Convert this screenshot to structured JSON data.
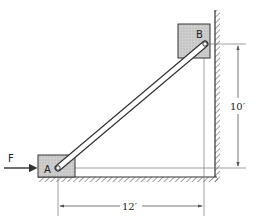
{
  "diagram": {
    "type": "statics-ladder-rod",
    "labels": {
      "force": "F",
      "block_a": "A",
      "block_b": "B",
      "vertical_dimension": "10′",
      "horizontal_dimension": "12′"
    },
    "colors": {
      "block_fill": "#c8c8c8",
      "line": "#333333",
      "rod_fill": "#ffffff",
      "dimension_line": "#555555"
    },
    "geometry": {
      "vertical_distance_ft": 10,
      "horizontal_distance_ft": 12
    }
  }
}
